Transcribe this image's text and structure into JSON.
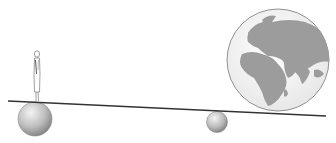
{
  "diagram": {
    "colors": {
      "background": "#ffffff",
      "beam": "#333333",
      "ball_light": "#f2f2f2",
      "ball_dark": "#8a8a8a",
      "globe_ocean": "#f5f5f5",
      "globe_land": "#9c9c9c",
      "globe_outline": "#777777",
      "figure_stroke": "#777777"
    },
    "elements": [
      {
        "name": "person",
        "position": "left end of beam, standing on ball"
      },
      {
        "name": "left-ball",
        "position": "under left end of beam"
      },
      {
        "name": "fulcrum-ball",
        "position": "under beam, center-right"
      },
      {
        "name": "globe",
        "position": "right end of beam"
      },
      {
        "name": "beam",
        "position": "slightly tilted line across the width"
      }
    ]
  }
}
